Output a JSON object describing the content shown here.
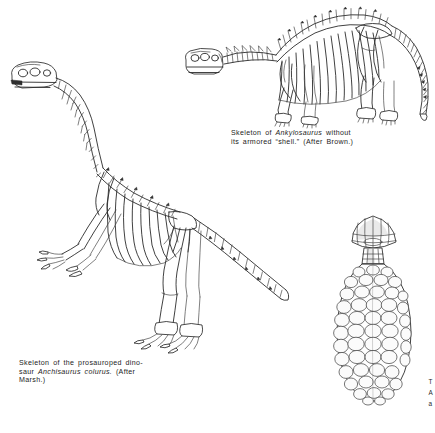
{
  "page": {
    "background_color": "#ffffff",
    "ink_color": "#2b2b2b",
    "width": 435,
    "height": 433
  },
  "figures": [
    {
      "id": "ankylosaurus-skeleton",
      "name": "Skeleton of Ankylosaurus",
      "position": "top-right",
      "description": "Quadrupedal armored dinosaur skeleton shown in left lateral view with arched dorsal vertebral column, broad ribcage, short stout limbs and long tapering tail"
    },
    {
      "id": "anchisaurus-skeleton",
      "name": "Skeleton of Anchisaurus colurus",
      "position": "left",
      "description": "Bipedal prosauropod skeleton in left lateral view with long neck, small skull, grasping forelimbs, columnar hind limbs and long tail trailing to the right"
    },
    {
      "id": "cycad-cone",
      "name": "Fossil cycadeoid cone",
      "position": "bottom-right",
      "description": "Ovoid cone covered in overlapping rhomboid scales with a flared mushroom-like apical cap on a short stalk"
    }
  ],
  "captions": {
    "ankylosaurus": {
      "line1_pre": "Skeleton of ",
      "line1_italic": "Ankylosaurus",
      "line1_post": " without",
      "line2": "its armored “shell.” (After Brown.)"
    },
    "anchisaurus": {
      "line1": "Skeleton of the prosauroped dino-",
      "line2_pre": "saur ",
      "line2_italic": "Anchisaurus colurus.",
      "line2_post": " (After",
      "line3": "Marsh.)"
    }
  },
  "edge_text": {
    "lines": [
      "T",
      "A",
      "a"
    ]
  }
}
